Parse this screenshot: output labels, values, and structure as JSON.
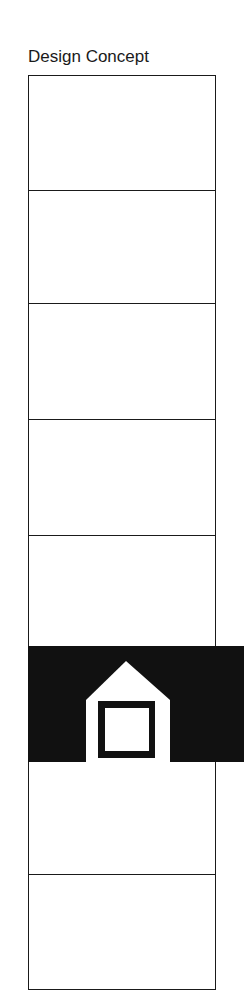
{
  "title": "Design Concept",
  "diagram": {
    "sections": 8,
    "highlighted_section_index": 5,
    "highlight_icon": "house-icon",
    "colors": {
      "line": "#1a1a1a",
      "fill": "#111111",
      "background": "#ffffff"
    }
  }
}
